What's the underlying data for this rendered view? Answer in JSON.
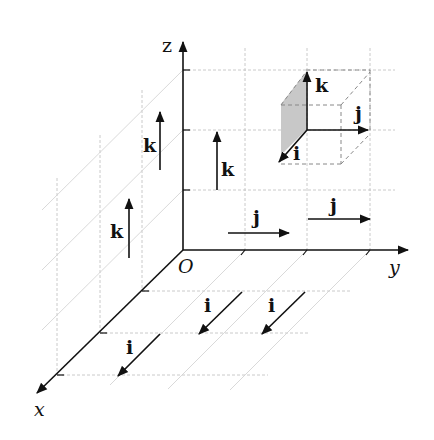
{
  "diagram": {
    "type": "3D coordinate axes with standard unit basis vectors",
    "origin_label": "O",
    "axes": [
      {
        "name": "x",
        "label": "x"
      },
      {
        "name": "y",
        "label": "y"
      },
      {
        "name": "z",
        "label": "z"
      }
    ],
    "unit_vectors": {
      "i": "i",
      "j": "j",
      "k": "k"
    },
    "vectors": [
      {
        "label": "k",
        "direction": "z",
        "location": "left back plane, upper"
      },
      {
        "label": "k",
        "direction": "z",
        "location": "near z-axis"
      },
      {
        "label": "k",
        "direction": "z",
        "location": "left back plane, lower"
      },
      {
        "label": "j",
        "direction": "y",
        "location": "yz-plane, near origin"
      },
      {
        "label": "j",
        "direction": "y",
        "location": "yz-plane, right"
      },
      {
        "label": "i",
        "direction": "x",
        "location": "xy-plane, middle"
      },
      {
        "label": "i",
        "direction": "x",
        "location": "xy-plane, right"
      },
      {
        "label": "i",
        "direction": "x",
        "location": "xy-plane, front"
      }
    ],
    "cube": {
      "description": "Unit cube with i, j, k drawn from one corner; one face shaded gray",
      "labels": [
        "k",
        "j",
        "i"
      ],
      "shade_color": "#c8c8c8"
    },
    "colors": {
      "line": "#111111",
      "grid": "#bdbdbd",
      "background": "#ffffff"
    }
  }
}
